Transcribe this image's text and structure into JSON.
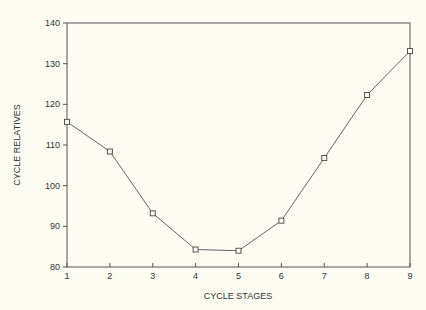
{
  "chart_data": {
    "type": "line",
    "title": "",
    "xlabel": "CYCLE STAGES",
    "ylabel": "CYCLE RELATIVES",
    "x": [
      1,
      2,
      3,
      4,
      5,
      6,
      7,
      8,
      9
    ],
    "series": [
      {
        "name": "Cycle relatives",
        "values": [
          115.7,
          108.4,
          93.2,
          84.3,
          84.0,
          91.4,
          106.8,
          122.3,
          133.1
        ],
        "marker": "open-square",
        "color": "#555555"
      }
    ],
    "xlim": [
      1,
      9
    ],
    "ylim": [
      80,
      140
    ],
    "xticks": [
      1,
      2,
      3,
      4,
      5,
      6,
      7,
      8,
      9
    ],
    "yticks": [
      80,
      90,
      100,
      110,
      120,
      130,
      140
    ],
    "grid": false,
    "legend": null
  },
  "colors": {
    "background": "#fcfcf2",
    "axis": "#555555",
    "line": "#666666"
  }
}
